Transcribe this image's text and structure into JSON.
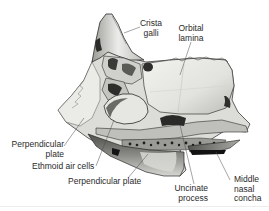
{
  "figure": {
    "colors": {
      "background": "#ffffff",
      "bone_light": "#e9e9e6",
      "bone_mid": "#c9c9c5",
      "bone_shadow": "#6a6a66",
      "bone_dark": "#1e1e1c",
      "label_text": "#2a2a2a",
      "leader_line": "#4a4a4a"
    },
    "labels": [
      {
        "id": "crista-galli",
        "text": "Crista\ngalli",
        "x": 141,
        "y": 19
      },
      {
        "id": "orbital-lamina",
        "text": "Orbital\nlamina",
        "x": 178,
        "y": 24
      },
      {
        "id": "perpendicular-plate-left",
        "text": "Perpendicular\nplate",
        "x": 10,
        "y": 143
      },
      {
        "id": "ethmoid-air-cells",
        "text": "Ethmoid air cells",
        "x": 32,
        "y": 164
      },
      {
        "id": "perpendicular-plate-bottom",
        "text": "Perpendicular plate",
        "x": 68,
        "y": 179
      },
      {
        "id": "uncinate-process",
        "text": "Uncinate\nprocess",
        "x": 173,
        "y": 184
      },
      {
        "id": "middle-nasal-concha",
        "text": "Middle\nnasal\nconcha",
        "x": 234,
        "y": 176
      }
    ]
  }
}
